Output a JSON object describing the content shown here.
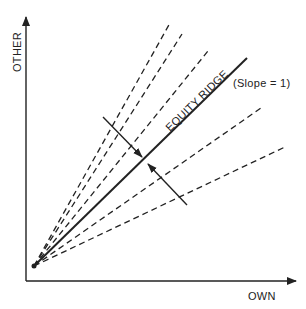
{
  "diagram": {
    "type": "line-diagram",
    "axes": {
      "x_label": "OWN",
      "y_label": "OTHER"
    },
    "origin": [
      34,
      266
    ],
    "ridge": {
      "label": "EQUITY RIDGE",
      "annotation": "(Slope = 1)",
      "end": [
        247,
        58
      ]
    },
    "dashed_lines": [
      {
        "end": [
          170,
          23
        ]
      },
      {
        "end": [
          182,
          34
        ]
      },
      {
        "end": [
          208,
          51
        ]
      },
      {
        "end": [
          261,
          108
        ]
      },
      {
        "end": [
          287,
          146
        ]
      }
    ],
    "arrows": [
      {
        "from": [
          103,
          117
        ],
        "to": [
          142,
          157
        ],
        "direction": "toward-ridge-from-above"
      },
      {
        "from": [
          187,
          205
        ],
        "to": [
          148,
          164
        ],
        "direction": "toward-ridge-from-below"
      }
    ],
    "colors": {
      "ink": "#222222",
      "background": "#ffffff"
    }
  }
}
